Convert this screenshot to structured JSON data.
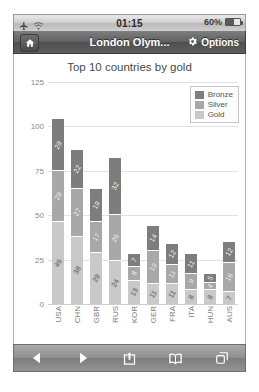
{
  "status_bar": {
    "airplane_icon": "airplane-icon",
    "wifi_icon": "wifi-icon",
    "time": "01:15",
    "battery_percent": "60%",
    "battery_level": 60
  },
  "nav_bar": {
    "home_icon": "home-icon",
    "title": "London Olym...",
    "gear_icon": "gear-icon",
    "options_label": "Options"
  },
  "chart_data": {
    "type": "bar",
    "subtype": "stacked",
    "title": "Top 10 countries by gold",
    "xlabel": "",
    "ylabel": "",
    "ylim": [
      0,
      125
    ],
    "yticks": [
      "0",
      "25",
      "50",
      "75",
      "100",
      "125"
    ],
    "grid": true,
    "legend_position": "top-right",
    "categories": [
      "USA",
      "CHN",
      "GBR",
      "RUS",
      "KOR",
      "GER",
      "FRA",
      "ITA",
      "HUN",
      "AUS"
    ],
    "series": [
      {
        "name": "Gold",
        "color": "#c9c9c9",
        "values": [
          46,
          38,
          29,
          24,
          13,
          11,
          11,
          8,
          8,
          7
        ]
      },
      {
        "name": "Silver",
        "color": "#a8a8a8",
        "values": [
          29,
          27,
          17,
          26,
          8,
          19,
          11,
          9,
          4,
          16
        ]
      },
      {
        "name": "Bronze",
        "color": "#7d7d7d",
        "values": [
          29,
          22,
          19,
          32,
          7,
          14,
          12,
          11,
          5,
          12
        ]
      }
    ],
    "bar_labels": {
      "USA": {
        "gold": "46",
        "silver": "29",
        "bronze": "29"
      },
      "CHN": {
        "gold": "38",
        "silver": "27",
        "bronze": "22"
      },
      "GBR": {
        "gold": "29",
        "silver": "17",
        "bronze": "19"
      },
      "RUS": {
        "gold": "24",
        "silver": "26",
        "bronze": "32"
      },
      "KOR": {
        "gold": "13",
        "silver": "8",
        "bronze": "7"
      },
      "GER": {
        "gold": "11",
        "silver": "19",
        "bronze": "14"
      },
      "FRA": {
        "gold": "11",
        "silver": "11",
        "bronze": "12"
      },
      "ITA": {
        "gold": "8",
        "silver": "9",
        "bronze": "11"
      },
      "HUN": {
        "gold": "8",
        "silver": "4",
        "bronze": "5"
      },
      "AUS": {
        "gold": "7",
        "silver": "16",
        "bronze": "12"
      }
    },
    "legend": [
      {
        "label": "Bronze",
        "color": "#7d7d7d"
      },
      {
        "label": "Silver",
        "color": "#a8a8a8"
      },
      {
        "label": "Gold",
        "color": "#c9c9c9"
      }
    ]
  },
  "toolbar": {
    "back_icon": "back-arrow-icon",
    "forward_icon": "forward-arrow-icon",
    "share_icon": "share-icon",
    "bookmarks_icon": "book-icon",
    "tabs_icon": "tabs-icon"
  }
}
